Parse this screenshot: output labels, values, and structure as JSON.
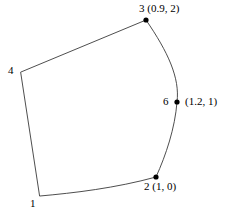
{
  "figure": {
    "type": "geometry-diagram",
    "background_color": "#ffffff",
    "stroke_color": "#3a3a3a",
    "point_color": "#000000",
    "stroke_width": 0.9,
    "point_radius": 2.6,
    "width": 226,
    "height": 213
  },
  "labels": {
    "vertex3": "3 (0.9, 2)",
    "vertex6": "(1.2, 1)",
    "vertex6_number": "6",
    "vertex2": "2 (1, 0)",
    "vertex4": "4",
    "vertex1": "1"
  },
  "chart_data": {
    "type": "scatter",
    "title": "",
    "xlabel": "",
    "ylabel": "",
    "grid": false,
    "legend": null,
    "annotations": [
      "3 (0.9, 2)",
      "(1.2, 1)",
      "2 (1, 0)",
      "4",
      "1"
    ],
    "points": [
      {
        "id": "1",
        "label": "1",
        "value_label": null,
        "px": 40,
        "py": 196,
        "marker": false
      },
      {
        "id": "2",
        "label": "2",
        "value_label": "(1, 0)",
        "x": 1,
        "y": 0,
        "px": 156,
        "py": 177,
        "marker": true
      },
      {
        "id": "3",
        "label": "3",
        "value_label": "(0.9, 2)",
        "x": 0.9,
        "y": 2,
        "px": 146,
        "py": 20,
        "marker": true
      },
      {
        "id": "4",
        "label": "4",
        "value_label": null,
        "px": 21,
        "py": 72,
        "marker": false
      },
      {
        "id": "6",
        "label": "6",
        "value_label": "(1.2, 1)",
        "x": 1.2,
        "y": 1,
        "px": 177,
        "py": 102,
        "marker": true
      }
    ],
    "edges": [
      {
        "from": "4",
        "to": "3",
        "shape": "straight"
      },
      {
        "from": "3",
        "to": "2",
        "shape": "curved-arc-bulging-right",
        "passes_through": "6"
      },
      {
        "from": "2",
        "to": "1",
        "shape": "nearly-straight-slight-bow"
      },
      {
        "from": "1",
        "to": "4",
        "shape": "straight"
      }
    ]
  }
}
